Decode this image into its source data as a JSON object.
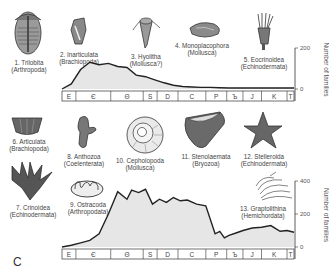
{
  "panel_label": "C",
  "colors": {
    "fill": "#e6e6e6",
    "line": "#222222",
    "text": "#444444"
  },
  "fossils": [
    {
      "id": 1,
      "name": "1. Trilobita",
      "phylum": "(Arthropoda)",
      "icon": "trilobite-icon"
    },
    {
      "id": 2,
      "name": "2. Inarticulata",
      "phylum": "(Brachiopoda)",
      "icon": "inarticulate-brachiopod-icon"
    },
    {
      "id": 3,
      "name": "3. Hyolitha",
      "phylum": "(Mollusca?)",
      "icon": "hyolith-icon"
    },
    {
      "id": 4,
      "name": "4. Monoplacophora",
      "phylum": "(Mollusca)",
      "icon": "monoplacophoran-icon"
    },
    {
      "id": 5,
      "name": "5. Eocrinoidea",
      "phylum": "(Echinodermata)",
      "icon": "eocrinoid-icon"
    },
    {
      "id": 6,
      "name": "6. Articulata",
      "phylum": "(Brachiopoda)",
      "icon": "articulate-brachiopod-icon"
    },
    {
      "id": 7,
      "name": "7. Crinoidea",
      "phylum": "(Echinodermata)",
      "icon": "crinoid-icon"
    },
    {
      "id": 8,
      "name": "8. Anthozoa",
      "phylum": "(Coelenterata)",
      "icon": "coral-icon"
    },
    {
      "id": 9,
      "name": "9. Ostracoda",
      "phylum": "(Arthropodata)",
      "icon": "ostracod-icon"
    },
    {
      "id": 10,
      "name": "10. Cepholopoda",
      "phylum": "(Mollusca)",
      "icon": "ammonite-icon"
    },
    {
      "id": 11,
      "name": "11. Stenolaemata",
      "phylum": "(Bryozoa)",
      "icon": "bryozoan-icon"
    },
    {
      "id": 12,
      "name": "12. Stelleroida",
      "phylum": "(Echinodermata)",
      "icon": "starfish-icon"
    },
    {
      "id": 13,
      "name": "13. Graptolithina",
      "phylum": "(Hemichordata)",
      "icon": "graptolite-icon"
    }
  ],
  "chart_data": [
    {
      "type": "area",
      "title": "Cambrian fauna",
      "xlabel": "Geologic period",
      "ylabel": "Number of families",
      "ylim": [
        0,
        200
      ],
      "yticks": [
        "0",
        "200"
      ],
      "periods": [
        "E",
        "Є",
        "Θ",
        "S",
        "D",
        "C",
        "P",
        "Ъ",
        "J",
        "K",
        "T"
      ],
      "x": [
        0,
        4,
        8,
        12,
        16,
        20,
        24,
        28,
        32,
        36,
        40,
        44,
        48,
        52,
        56,
        60,
        64,
        68,
        72,
        76,
        80,
        84,
        88,
        92,
        96,
        100
      ],
      "values": [
        0,
        25,
        95,
        130,
        118,
        125,
        110,
        105,
        68,
        60,
        45,
        30,
        18,
        12,
        10,
        8,
        8,
        6,
        5,
        5,
        5,
        5,
        5,
        5,
        5,
        5
      ]
    },
    {
      "type": "area",
      "title": "Paleozoic fauna",
      "xlabel": "Geologic period",
      "ylabel": "Number of families",
      "ylim": [
        0,
        400
      ],
      "yticks": [
        "0",
        "200",
        "400"
      ],
      "periods": [
        "E",
        "Є",
        "Θ",
        "S",
        "D",
        "C",
        "P",
        "Ъ",
        "J",
        "K",
        "T"
      ],
      "x": [
        0,
        4,
        8,
        12,
        16,
        20,
        24,
        28,
        30,
        33,
        36,
        39,
        42,
        45,
        48,
        51,
        54,
        58,
        62,
        66,
        68,
        70,
        72,
        75,
        78,
        82,
        86,
        90,
        94,
        97,
        100
      ],
      "values": [
        0,
        10,
        25,
        40,
        80,
        200,
        335,
        290,
        345,
        330,
        350,
        260,
        290,
        270,
        300,
        280,
        285,
        260,
        250,
        80,
        95,
        55,
        70,
        85,
        100,
        115,
        120,
        130,
        95,
        100,
        90
      ]
    }
  ]
}
